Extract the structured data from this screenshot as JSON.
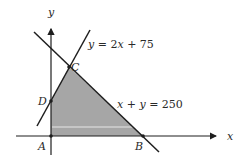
{
  "diagram": {
    "type": "linear-programming-feasible-region",
    "axes": {
      "x_label": "x",
      "y_label": "y"
    },
    "lines": [
      {
        "id": "line1",
        "equation": "y = 2x + 75",
        "label_parts": [
          "y",
          " = 2",
          "x",
          " + 75"
        ]
      },
      {
        "id": "line2",
        "equation": "x + y = 250",
        "label_parts": [
          "x",
          " + ",
          "y",
          " = 250"
        ]
      }
    ],
    "vertices": [
      {
        "name": "A",
        "label": "A"
      },
      {
        "name": "B",
        "label": "B"
      },
      {
        "name": "C",
        "label": "C"
      },
      {
        "name": "D",
        "label": "D"
      }
    ],
    "region": {
      "label": "feasible region",
      "fill": "#a6a6a6"
    },
    "colors": {
      "line": "#1e1e1e",
      "region_fill": "#a6a6a6",
      "background": "#ffffff"
    }
  }
}
